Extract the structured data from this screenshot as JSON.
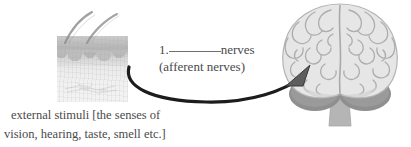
{
  "figure": {
    "background_color": "#ffffff",
    "ink_color": "#4a4a4a"
  },
  "skin": {
    "name": "skin cross-section with hair follicles",
    "alt": "grayscale micrograph of skin showing epidermis, dermal papillae and hair shafts",
    "hair_count": "2",
    "colors": {
      "epidermis": "#b4b4b4",
      "dermis": "#f1f1f1",
      "hair": "#8f8f8f"
    }
  },
  "brain": {
    "name": "human brain frontal view",
    "alt": "grayscale illustration of a brain seen from the front with cerebellum and brainstem",
    "colors": {
      "cortex": "#e3e3e3",
      "sulci": "#a9a9a9",
      "cerebellum": "#9a9a9a",
      "brainstem": "#b5b5b5",
      "outline": "#b0b0b0"
    }
  },
  "arrow": {
    "name": "curved arrow from skin to brain",
    "direction": "left-to-right",
    "color": "#1f1f1f",
    "head_color": "#5a5a5a"
  },
  "label": {
    "number": "1.",
    "blank": "",
    "term": "nerves",
    "answer": "(afferent nerves)"
  },
  "caption": {
    "line1": "external stimuli [the senses of",
    "line2": "vision, hearing, taste, smell etc.]"
  }
}
